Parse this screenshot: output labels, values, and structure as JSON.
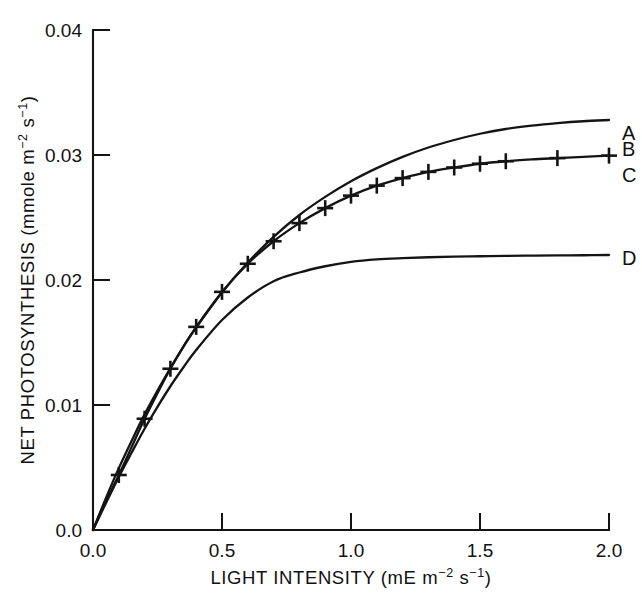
{
  "figure": {
    "background": "#ffffff",
    "ink_color": "#141414"
  },
  "chart_data": {
    "type": "line",
    "title": "",
    "xlabel": "LIGHT INTENSITY (mE m⁻² s⁻¹)",
    "ylabel": "NET PHOTOSYNTHESIS (mmole m⁻² s⁻¹)",
    "xlabel_parts": {
      "lead": "LIGHT INTENSITY (mE m",
      "sup1": "−2",
      "mid": " s",
      "sup2": "−1",
      "tail": ")"
    },
    "ylabel_parts": {
      "lead": "NET PHOTOSYNTHESIS (mmole m",
      "sup1": "−2",
      "mid": " s",
      "sup2": "−1",
      "tail": ")"
    },
    "xlim": [
      0.0,
      2.0
    ],
    "ylim": [
      0.0,
      0.04
    ],
    "xticks": [
      0.0,
      0.5,
      1.0,
      1.5,
      2.0
    ],
    "xtick_labels": [
      "0.0",
      "0.5",
      "1.0",
      "1.5",
      "2.0"
    ],
    "yticks": [
      0.0,
      0.01,
      0.02,
      0.03,
      0.04
    ],
    "ytick_labels": [
      "0.0",
      "0.01",
      "0.02",
      "0.03",
      "0.04"
    ],
    "grid": false,
    "legend_position": "right-of-axes-inline",
    "tick_direction": "in",
    "axes_spines": [
      "left",
      "bottom"
    ],
    "series": [
      {
        "name": "A",
        "label": "A",
        "style": "solid-line",
        "marker": "none",
        "label_y": 0.0318,
        "x": [
          0.0,
          0.05,
          0.1,
          0.15,
          0.2,
          0.25,
          0.3,
          0.35,
          0.4,
          0.5,
          0.6,
          0.7,
          0.8,
          0.9,
          1.0,
          1.1,
          1.2,
          1.3,
          1.4,
          1.5,
          1.6,
          1.7,
          1.8,
          1.9,
          2.0
        ],
        "y": [
          0.0,
          0.00255,
          0.00495,
          0.00715,
          0.00925,
          0.01115,
          0.01295,
          0.01465,
          0.0162,
          0.019,
          0.0214,
          0.02345,
          0.0252,
          0.02665,
          0.0279,
          0.02895,
          0.02985,
          0.0306,
          0.0312,
          0.0317,
          0.03208,
          0.03235,
          0.03255,
          0.0327,
          0.0328
        ]
      },
      {
        "name": "B",
        "label": "B",
        "style": "markers",
        "marker": "plus",
        "label_y": 0.0305,
        "x": [
          0.1,
          0.2,
          0.3,
          0.4,
          0.5,
          0.6,
          0.7,
          0.8,
          0.9,
          1.0,
          1.1,
          1.2,
          1.3,
          1.4,
          1.5,
          1.6,
          1.8,
          2.0
        ],
        "y": [
          0.0044,
          0.0089,
          0.0129,
          0.01625,
          0.01905,
          0.0213,
          0.0231,
          0.02455,
          0.02575,
          0.02675,
          0.02755,
          0.02815,
          0.02865,
          0.029,
          0.0293,
          0.0295,
          0.02975,
          0.02995
        ]
      },
      {
        "name": "C",
        "label": "C",
        "style": "solid-line",
        "marker": "none",
        "label_y": 0.0284,
        "x": [
          0.0,
          0.05,
          0.1,
          0.15,
          0.2,
          0.25,
          0.3,
          0.35,
          0.4,
          0.5,
          0.6,
          0.7,
          0.8,
          0.9,
          1.0,
          1.1,
          1.2,
          1.3,
          1.4,
          1.5,
          1.6,
          1.7,
          1.8,
          1.9,
          2.0
        ],
        "y": [
          0.0,
          0.0023,
          0.0044,
          0.00665,
          0.0089,
          0.01095,
          0.0129,
          0.01465,
          0.01625,
          0.01905,
          0.0213,
          0.0231,
          0.02455,
          0.02575,
          0.02675,
          0.02755,
          0.02815,
          0.02865,
          0.029,
          0.0293,
          0.0295,
          0.02965,
          0.02975,
          0.02985,
          0.02995
        ]
      },
      {
        "name": "D",
        "label": "D",
        "style": "solid-line",
        "marker": "none",
        "label_y": 0.0218,
        "x": [
          0.0,
          0.05,
          0.1,
          0.15,
          0.2,
          0.25,
          0.3,
          0.35,
          0.4,
          0.5,
          0.6,
          0.7,
          0.8,
          0.9,
          1.0,
          1.1,
          1.2,
          1.3,
          1.4,
          1.5,
          1.6,
          1.7,
          1.8,
          1.9,
          2.0
        ],
        "y": [
          0.0,
          0.00215,
          0.00425,
          0.0062,
          0.0081,
          0.00985,
          0.0115,
          0.013,
          0.0144,
          0.0168,
          0.0186,
          0.0199,
          0.0206,
          0.0211,
          0.02145,
          0.02165,
          0.02175,
          0.02182,
          0.02187,
          0.0219,
          0.02193,
          0.02195,
          0.02197,
          0.02198,
          0.022
        ]
      }
    ]
  }
}
